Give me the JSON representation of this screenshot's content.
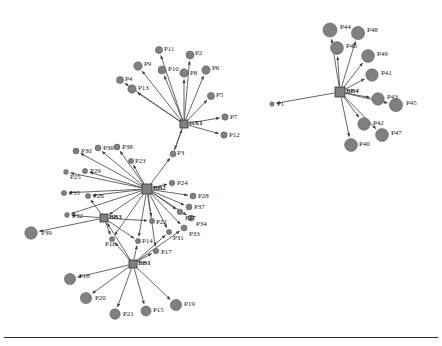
{
  "figure": {
    "type": "network-graph",
    "background_color": "#ffffff",
    "node_color": "#808080",
    "node_stroke": "#4d4d4d",
    "edge_color": "#4a4a4a",
    "label_color": "#1a1a1a",
    "width": 442,
    "height": 346,
    "bottom_rule": true
  },
  "hubs": [
    {
      "id": "GX1",
      "label": "GX1",
      "x": 184,
      "y": 124,
      "shape": "square",
      "size": 4
    },
    {
      "id": "BB4",
      "label": "BB4",
      "x": 340,
      "y": 92,
      "shape": "square",
      "size": 5
    },
    {
      "id": "BB2",
      "label": "BB2",
      "x": 147,
      "y": 189,
      "shape": "square",
      "size": 5
    },
    {
      "id": "BB3",
      "label": "BB3",
      "x": 104,
      "y": 218,
      "shape": "square",
      "size": 4
    },
    {
      "id": "BB1",
      "label": "BB1",
      "x": 133,
      "y": 264,
      "shape": "square",
      "size": 4
    }
  ],
  "nodes": [
    {
      "id": "P1",
      "label": "P1",
      "x": 272,
      "y": 104,
      "r": 2.2,
      "lx": 277,
      "ly": 101
    },
    {
      "id": "P2",
      "label": "P2",
      "x": 190,
      "y": 55,
      "r": 4.0,
      "lx": 195,
      "ly": 50
    },
    {
      "id": "P3",
      "label": "P3",
      "x": 173,
      "y": 154,
      "r": 3.0,
      "lx": 177,
      "ly": 150
    },
    {
      "id": "P4",
      "label": "P4",
      "x": 120,
      "y": 80,
      "r": 3.6,
      "lx": 125,
      "ly": 76
    },
    {
      "id": "P5",
      "label": "P5",
      "x": 211,
      "y": 96,
      "r": 3.6,
      "lx": 216,
      "ly": 92
    },
    {
      "id": "P6",
      "label": "P6",
      "x": 206,
      "y": 70,
      "r": 4.2,
      "lx": 212,
      "ly": 65
    },
    {
      "id": "P7",
      "label": "P7",
      "x": 225,
      "y": 117,
      "r": 3.2,
      "lx": 230,
      "ly": 114
    },
    {
      "id": "P8",
      "label": "P8",
      "x": 184,
      "y": 73,
      "r": 4.2,
      "lx": 190,
      "ly": 70
    },
    {
      "id": "P9",
      "label": "P9",
      "x": 138,
      "y": 66,
      "r": 4.2,
      "lx": 144,
      "ly": 61
    },
    {
      "id": "P10",
      "label": "P10",
      "x": 162,
      "y": 70,
      "r": 4.0,
      "lx": 168,
      "ly": 66
    },
    {
      "id": "P11",
      "label": "P11",
      "x": 159,
      "y": 50,
      "r": 3.6,
      "lx": 164,
      "ly": 46
    },
    {
      "id": "P12",
      "label": "P12",
      "x": 224,
      "y": 135,
      "r": 3.2,
      "lx": 229,
      "ly": 132
    },
    {
      "id": "P13",
      "label": "P13",
      "x": 132,
      "y": 89,
      "r": 4.2,
      "lx": 138,
      "ly": 85
    },
    {
      "id": "P14",
      "label": "P14",
      "x": 138,
      "y": 241,
      "r": 2.6,
      "lx": 142,
      "ly": 238
    },
    {
      "id": "P15",
      "label": "P15",
      "x": 146,
      "y": 311,
      "r": 5.0,
      "lx": 153,
      "ly": 307
    },
    {
      "id": "P16",
      "label": "P16",
      "x": 112,
      "y": 239,
      "r": 2.6,
      "lx": 105,
      "ly": 241
    },
    {
      "id": "P17",
      "label": "P17",
      "x": 156,
      "y": 251,
      "r": 2.8,
      "lx": 161,
      "ly": 249
    },
    {
      "id": "P18",
      "label": "P18",
      "x": 70,
      "y": 279,
      "r": 5.6,
      "lx": 79,
      "ly": 273
    },
    {
      "id": "P19",
      "label": "P19",
      "x": 176,
      "y": 305,
      "r": 5.6,
      "lx": 184,
      "ly": 301
    },
    {
      "id": "P20",
      "label": "P20",
      "x": 86,
      "y": 298,
      "r": 5.6,
      "lx": 95,
      "ly": 295
    },
    {
      "id": "P21",
      "label": "P21",
      "x": 115,
      "y": 314,
      "r": 5.2,
      "lx": 123,
      "ly": 311
    },
    {
      "id": "P22",
      "label": "P22",
      "x": 152,
      "y": 221,
      "r": 2.6,
      "lx": 156,
      "ly": 219
    },
    {
      "id": "P23",
      "label": "P23",
      "x": 131,
      "y": 161,
      "r": 2.6,
      "lx": 135,
      "ly": 158
    },
    {
      "id": "P24",
      "label": "P24",
      "x": 172,
      "y": 183,
      "r": 2.8,
      "lx": 177,
      "ly": 180
    },
    {
      "id": "P25",
      "label": "P25",
      "x": 66,
      "y": 172,
      "r": 2.4,
      "lx": 70,
      "ly": 174
    },
    {
      "id": "P26",
      "label": "P26",
      "x": 88,
      "y": 196,
      "r": 2.6,
      "lx": 93,
      "ly": 193
    },
    {
      "id": "P27",
      "label": "P27",
      "x": 180,
      "y": 212,
      "r": 2.8,
      "lx": 185,
      "ly": 215
    },
    {
      "id": "P28",
      "label": "P28",
      "x": 193,
      "y": 196,
      "r": 3.0,
      "lx": 198,
      "ly": 193
    },
    {
      "id": "P29",
      "label": "P29",
      "x": 85,
      "y": 171,
      "r": 2.6,
      "lx": 90,
      "ly": 168
    },
    {
      "id": "P30",
      "label": "P30",
      "x": 76,
      "y": 151,
      "r": 3.0,
      "lx": 81,
      "ly": 148
    },
    {
      "id": "P31",
      "label": "P31",
      "x": 169,
      "y": 232,
      "r": 2.6,
      "lx": 173,
      "ly": 235
    },
    {
      "id": "P32",
      "label": "P32",
      "x": 67,
      "y": 215,
      "r": 2.4,
      "lx": 72,
      "ly": 213
    },
    {
      "id": "P33",
      "label": "P33",
      "x": 184,
      "y": 228,
      "r": 3.0,
      "lx": 189,
      "ly": 231
    },
    {
      "id": "P34",
      "label": "P34",
      "x": 191,
      "y": 218,
      "r": 3.0,
      "lx": 196,
      "ly": 221
    },
    {
      "id": "P35",
      "label": "P35",
      "x": 64,
      "y": 193,
      "r": 2.6,
      "lx": 69,
      "ly": 190
    },
    {
      "id": "P36",
      "label": "P36",
      "x": 98,
      "y": 148,
      "r": 3.0,
      "lx": 103,
      "ly": 145
    },
    {
      "id": "P37",
      "label": "P37",
      "x": 189,
      "y": 207,
      "r": 3.0,
      "lx": 194,
      "ly": 204
    },
    {
      "id": "P38",
      "label": "P38",
      "x": 117,
      "y": 147,
      "r": 3.0,
      "lx": 122,
      "ly": 144
    },
    {
      "id": "P39",
      "label": "P39",
      "x": 31,
      "y": 233,
      "r": 6.2,
      "lx": 41,
      "ly": 230
    },
    {
      "id": "P40",
      "label": "P40",
      "x": 351,
      "y": 145,
      "r": 6.4,
      "lx": 359,
      "ly": 141
    },
    {
      "id": "P41",
      "label": "P41",
      "x": 372,
      "y": 75,
      "r": 6.2,
      "lx": 381,
      "ly": 70
    },
    {
      "id": "P42",
      "label": "P42",
      "x": 364,
      "y": 124,
      "r": 6.2,
      "lx": 373,
      "ly": 120
    },
    {
      "id": "P43",
      "label": "P43",
      "x": 378,
      "y": 99,
      "r": 6.2,
      "lx": 387,
      "ly": 94
    },
    {
      "id": "P44",
      "label": "P44",
      "x": 330,
      "y": 30,
      "r": 7.0,
      "lx": 340,
      "ly": 24
    },
    {
      "id": "P45",
      "label": "P45",
      "x": 396,
      "y": 105,
      "r": 6.6,
      "lx": 406,
      "ly": 100
    },
    {
      "id": "P46",
      "label": "P46",
      "x": 337,
      "y": 48,
      "r": 6.4,
      "lx": 346,
      "ly": 43
    },
    {
      "id": "P47",
      "label": "P47",
      "x": 382,
      "y": 135,
      "r": 6.4,
      "lx": 391,
      "ly": 130
    },
    {
      "id": "P48",
      "label": "P48",
      "x": 358,
      "y": 33,
      "r": 6.6,
      "lx": 367,
      "ly": 27
    },
    {
      "id": "P49",
      "label": "P49",
      "x": 368,
      "y": 56,
      "r": 6.4,
      "lx": 377,
      "ly": 51
    }
  ],
  "edges": [
    {
      "from": "GX1",
      "to": "P2"
    },
    {
      "from": "GX1",
      "to": "P4"
    },
    {
      "from": "GX1",
      "to": "P5"
    },
    {
      "from": "GX1",
      "to": "P6"
    },
    {
      "from": "GX1",
      "to": "P7"
    },
    {
      "from": "GX1",
      "to": "P8"
    },
    {
      "from": "GX1",
      "to": "P9"
    },
    {
      "from": "GX1",
      "to": "P10"
    },
    {
      "from": "GX1",
      "to": "P11"
    },
    {
      "from": "GX1",
      "to": "P12"
    },
    {
      "from": "GX1",
      "to": "P13"
    },
    {
      "from": "GX1",
      "to": "P3"
    },
    {
      "from": "BB4",
      "to": "P1"
    },
    {
      "from": "BB4",
      "to": "P40"
    },
    {
      "from": "BB4",
      "to": "P41"
    },
    {
      "from": "BB4",
      "to": "P42"
    },
    {
      "from": "BB4",
      "to": "P43"
    },
    {
      "from": "BB4",
      "to": "P44"
    },
    {
      "from": "BB4",
      "to": "P45"
    },
    {
      "from": "BB4",
      "to": "P46"
    },
    {
      "from": "BB4",
      "to": "P47"
    },
    {
      "from": "BB4",
      "to": "P48"
    },
    {
      "from": "BB4",
      "to": "P49"
    },
    {
      "from": "BB2",
      "to": "P3"
    },
    {
      "from": "BB2",
      "to": "P22"
    },
    {
      "from": "BB2",
      "to": "P23"
    },
    {
      "from": "BB2",
      "to": "P24"
    },
    {
      "from": "BB2",
      "to": "P25"
    },
    {
      "from": "BB2",
      "to": "P26"
    },
    {
      "from": "BB2",
      "to": "P27"
    },
    {
      "from": "BB2",
      "to": "P28"
    },
    {
      "from": "BB2",
      "to": "P29"
    },
    {
      "from": "BB2",
      "to": "P30"
    },
    {
      "from": "BB2",
      "to": "P31"
    },
    {
      "from": "BB2",
      "to": "P32"
    },
    {
      "from": "BB2",
      "to": "P33"
    },
    {
      "from": "BB2",
      "to": "P34"
    },
    {
      "from": "BB2",
      "to": "P35"
    },
    {
      "from": "BB2",
      "to": "P36"
    },
    {
      "from": "BB2",
      "to": "P37"
    },
    {
      "from": "BB2",
      "to": "P38"
    },
    {
      "from": "BB2",
      "to": "P14"
    },
    {
      "from": "BB2",
      "to": "P16"
    },
    {
      "from": "BB2",
      "to": "P17"
    },
    {
      "from": "BB2",
      "to": "BB3"
    },
    {
      "from": "BB3",
      "to": "P26"
    },
    {
      "from": "BB3",
      "to": "P32"
    },
    {
      "from": "BB3",
      "to": "P16"
    },
    {
      "from": "BB3",
      "to": "P14"
    },
    {
      "from": "BB3",
      "to": "P22"
    },
    {
      "from": "BB3",
      "to": "P39"
    },
    {
      "from": "BB1",
      "to": "P14"
    },
    {
      "from": "BB1",
      "to": "P15"
    },
    {
      "from": "BB1",
      "to": "P16"
    },
    {
      "from": "BB1",
      "to": "P17"
    },
    {
      "from": "BB1",
      "to": "P18"
    },
    {
      "from": "BB1",
      "to": "P19"
    },
    {
      "from": "BB1",
      "to": "P20"
    },
    {
      "from": "BB1",
      "to": "P21"
    },
    {
      "from": "BB1",
      "to": "P31"
    },
    {
      "from": "BB1",
      "to": "P33"
    },
    {
      "from": "BB1",
      "to": "BB3"
    },
    {
      "from": "P3",
      "to": "GX1"
    }
  ]
}
